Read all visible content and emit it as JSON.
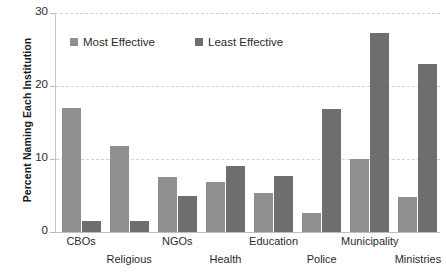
{
  "chart_data": {
    "type": "bar",
    "title": "",
    "xlabel": "",
    "ylabel": "Percent Naming Each Institution",
    "ylim": [
      0,
      30
    ],
    "yticks": [
      0,
      10,
      20,
      30
    ],
    "grid": true,
    "legend_position": "top-left-inside",
    "categories": [
      "CBOs",
      "Religious",
      "NGOs",
      "Health",
      "Education",
      "Police",
      "Municipality",
      "Ministries"
    ],
    "series": [
      {
        "name": "Most Effective",
        "color": "#8f8f8f",
        "values": [
          17.0,
          11.8,
          7.6,
          6.9,
          5.3,
          2.6,
          10.0,
          4.8
        ]
      },
      {
        "name": "Least Effective",
        "color": "#6e6e6e",
        "values": [
          1.5,
          1.5,
          4.9,
          9.1,
          7.7,
          16.8,
          27.3,
          23.0
        ]
      }
    ]
  },
  "axis": {
    "tick_labels": [
      "30",
      "20",
      "10",
      "0"
    ]
  },
  "legend": {
    "items": [
      {
        "label": "Most Effective",
        "swatch": "most"
      },
      {
        "label": "Least Effective",
        "swatch": "least"
      }
    ]
  }
}
